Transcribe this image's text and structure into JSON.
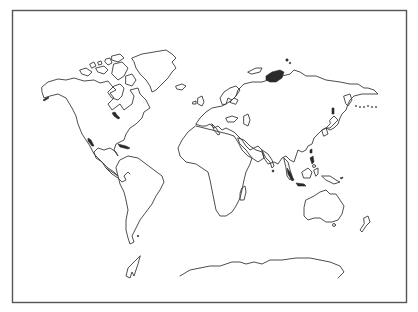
{
  "map": {
    "type": "world-outline-map",
    "style": "black-and-white hand-drawn coastline outline",
    "colors": {
      "background": "#ffffff",
      "stroke": "#3a3a3a",
      "border": "#555555",
      "filled": "#2a2a2a"
    },
    "frame": {
      "x": 12,
      "y": 10,
      "width": 395,
      "height": 293
    },
    "regions": [
      "north-america",
      "greenland",
      "canadian-arctic-islands",
      "central-america",
      "caribbean",
      "south-america",
      "europe",
      "british-isles",
      "scandinavia",
      "iceland",
      "africa",
      "madagascar",
      "arabian-peninsula",
      "asia",
      "indian-subcontinent",
      "sri-lanka",
      "japan",
      "southeast-asia",
      "indonesia",
      "philippines",
      "new-guinea",
      "australia",
      "tasmania",
      "new-zealand",
      "antarctica",
      "antarctic-peninsula",
      "novaya-zemlya",
      "severnaya-zemlya",
      "kuril-islands",
      "aleutian-islands"
    ]
  }
}
